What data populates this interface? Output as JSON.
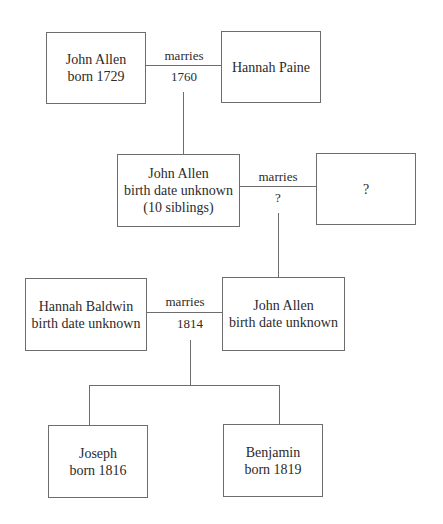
{
  "diagram": {
    "type": "family-tree",
    "people": [
      {
        "id": "john_allen_1729",
        "lines": [
          "John Allen",
          "born 1729"
        ]
      },
      {
        "id": "hannah_paine",
        "lines": [
          "Hannah Paine"
        ]
      },
      {
        "id": "john_allen_gen2",
        "lines": [
          "John Allen",
          "birth date unknown",
          "(10 siblings)"
        ]
      },
      {
        "id": "unknown_spouse",
        "lines": [
          "?"
        ]
      },
      {
        "id": "hannah_baldwin",
        "lines": [
          "Hannah Baldwin",
          "birth date unknown"
        ]
      },
      {
        "id": "john_allen_gen3",
        "lines": [
          "John Allen",
          "birth date unknown"
        ]
      },
      {
        "id": "joseph",
        "lines": [
          "Joseph",
          "born 1816"
        ]
      },
      {
        "id": "benjamin",
        "lines": [
          "Benjamin",
          "born 1819"
        ]
      }
    ],
    "marriages": [
      {
        "label": "marries",
        "date": "1760",
        "spouses": [
          "john_allen_1729",
          "hannah_paine"
        ],
        "children": [
          "john_allen_gen2"
        ]
      },
      {
        "label": "marries",
        "date": "?",
        "spouses": [
          "john_allen_gen2",
          "unknown_spouse"
        ],
        "children": [
          "john_allen_gen3"
        ]
      },
      {
        "label": "marries",
        "date": "1814",
        "spouses": [
          "hannah_baldwin",
          "john_allen_gen3"
        ],
        "children": [
          "joseph",
          "benjamin"
        ]
      }
    ]
  }
}
